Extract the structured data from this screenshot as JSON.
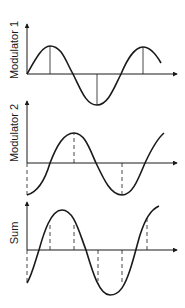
{
  "colors": {
    "stroke": "#1a1a1a",
    "background": "#ffffff"
  },
  "panels": [
    {
      "id": "modulator-1",
      "label": "Modulator 1",
      "label_pos": {
        "x": 14,
        "y": 50
      },
      "axis": {
        "x0": 27,
        "y_top": 24,
        "baseline": 74,
        "x_end": 177
      },
      "curve": "M27,74 C35,60 42,46 50,46 C62,46 66,62 73,74 C81,90 86,105 97,105 C108,105 114,88 121,74 C127,60 134,47 143,47 C151,47 157,56 161,63",
      "markers": [
        {
          "x": 50,
          "y": 46,
          "style": "solid"
        },
        {
          "x": 97,
          "y": 105,
          "style": "solid"
        },
        {
          "x": 143,
          "y": 47,
          "style": "solid"
        }
      ]
    },
    {
      "id": "modulator-2",
      "label": "Modulator 2",
      "label_pos": {
        "x": 14,
        "y": 133
      },
      "axis": {
        "x0": 27,
        "y_top": 101,
        "baseline": 163,
        "x_end": 177
      },
      "curve": "M27,195 C38,192 45,180 50,163 C57,145 64,133 74,133 C85,133 90,150 96,163 C104,180 111,195 122,195 C133,195 139,177 145,163 C152,148 158,138 164,133",
      "markers": [
        {
          "x": 27,
          "y": 195,
          "style": "dashed"
        },
        {
          "x": 74,
          "y": 133,
          "style": "dashed"
        },
        {
          "x": 122,
          "y": 195,
          "style": "dashed"
        }
      ]
    },
    {
      "id": "sum",
      "label": "Sum",
      "label_pos": {
        "x": 14,
        "y": 233
      },
      "axis": {
        "x0": 27,
        "y_top": 202,
        "baseline": 250,
        "x_end": 177
      },
      "curve": "M27,283 C32,275 35,262 39,250 C44,232 51,210 62,210 C74,210 79,232 86,250 C92,270 99,295 110,295 C120,295 125,285 130,270 C134,258 137,245 140,235 C145,220 150,210 159,206",
      "markers": [
        {
          "x": 27,
          "y": 283,
          "style": "dashed"
        },
        {
          "x": 50,
          "y": 222,
          "style": "dashed"
        },
        {
          "x": 74,
          "y": 223,
          "style": "dashed"
        },
        {
          "x": 98,
          "y": 281,
          "style": "dashed"
        },
        {
          "x": 122,
          "y": 283,
          "style": "dashed"
        },
        {
          "x": 147,
          "y": 215,
          "style": "dashed"
        }
      ]
    }
  ]
}
